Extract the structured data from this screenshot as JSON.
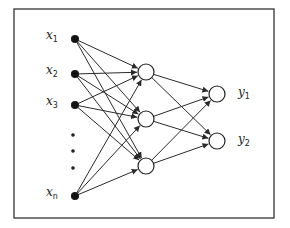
{
  "diagram": {
    "frame": {
      "x": 14,
      "y": 9,
      "width": 260,
      "height": 209,
      "stroke": "#333333"
    },
    "colors": {
      "line": "#2a2a2a",
      "node_fill_input": "#111111",
      "node_fill": "#ffffff"
    },
    "input_layer": [
      {
        "id": "x1",
        "label": "x",
        "sub": "1",
        "cx": 75,
        "cy": 39
      },
      {
        "id": "x2",
        "label": "x",
        "sub": "2",
        "cx": 75,
        "cy": 74
      },
      {
        "id": "x3",
        "label": "x",
        "sub": "3",
        "cx": 75,
        "cy": 105
      },
      {
        "id": "xn",
        "label": "x",
        "sub": "n",
        "cx": 75,
        "cy": 196
      }
    ],
    "ellipsis_dots": [
      {
        "cx": 73,
        "cy": 135
      },
      {
        "cx": 73,
        "cy": 151
      },
      {
        "cx": 73,
        "cy": 168
      }
    ],
    "hidden_layer": [
      {
        "id": "h1",
        "cx": 146,
        "cy": 72
      },
      {
        "id": "h2",
        "cx": 146,
        "cy": 119
      },
      {
        "id": "h3",
        "cx": 146,
        "cy": 166
      }
    ],
    "output_layer": [
      {
        "id": "y1",
        "label": "y",
        "sub": "1",
        "cx": 217,
        "cy": 94
      },
      {
        "id": "y2",
        "label": "y",
        "sub": "2",
        "cx": 217,
        "cy": 141
      }
    ],
    "node_radius": 8,
    "input_radius": 3.5
  }
}
